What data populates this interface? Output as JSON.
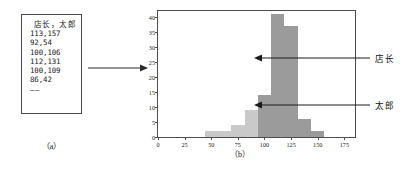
{
  "figure": {
    "panel_a": {
      "caption": "（a）",
      "data_box": {
        "header": "店长，太郎",
        "rows": [
          "113,157",
          "92,54",
          "100,106",
          "112,131",
          "100,109",
          "86,42"
        ],
        "continuation": "……"
      }
    },
    "panel_b": {
      "caption": "（b）",
      "callouts": [
        {
          "label": "店长",
          "series": "tencho"
        },
        {
          "label": "太郎",
          "series": "taro"
        }
      ]
    },
    "colors": {
      "series_tencho": "#9b9b9b",
      "series_taro": "#c9c9c9",
      "axis": "#4d4d4d",
      "text": "#111111"
    }
  },
  "chart_data": {
    "type": "bar",
    "title": "",
    "subtitle": "",
    "xlabel": "",
    "ylabel": "",
    "xlim": [
      0,
      185
    ],
    "ylim": [
      0,
      42
    ],
    "grid": false,
    "legend_position": "annotations-right",
    "xticks": [
      0,
      25,
      50,
      75,
      100,
      125,
      150,
      175
    ],
    "yticks": [
      0,
      5,
      10,
      15,
      20,
      25,
      30,
      35,
      40
    ],
    "bin_width": 12.5,
    "bin_edges": [
      43.75,
      56.25,
      68.75,
      81.25,
      93.75,
      106.25,
      118.75,
      131.25,
      143.75,
      156.25
    ],
    "series": [
      {
        "name": "太郎",
        "color": "#c9c9c9",
        "bin_starts": [
          43.75,
          56.25,
          68.75,
          81.25,
          93.75,
          106.25,
          118.75,
          131.25,
          143.75
        ],
        "values": [
          2,
          2,
          4,
          9,
          14,
          22,
          17,
          6,
          0
        ]
      },
      {
        "name": "店长",
        "color": "#9b9b9b",
        "bin_starts": [
          43.75,
          56.25,
          68.75,
          81.25,
          93.75,
          106.25,
          118.75,
          131.25,
          143.75
        ],
        "values": [
          0,
          0,
          0,
          0,
          14,
          41,
          37,
          6,
          2
        ]
      }
    ],
    "annotations": [
      {
        "text": "店长",
        "target_value": 27,
        "target_bin": 106.25
      },
      {
        "text": "太郎",
        "target_value": 12,
        "target_bin": 118.75
      }
    ]
  }
}
